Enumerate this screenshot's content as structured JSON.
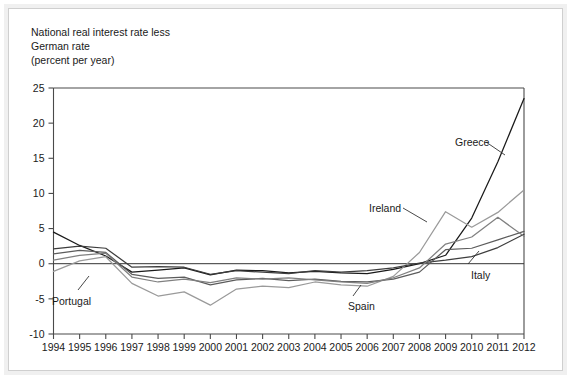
{
  "figure": {
    "title_lines": "National real interest rate less\nGerman rate\n(percent per year)",
    "background_color": "#ffffff",
    "border_color": "#cfcfcf"
  },
  "axes": {
    "y_label_25": "25",
    "y_label_20": "20",
    "y_label_15": "15",
    "y_label_10": "10",
    "y_label_5": "5",
    "y_label_0": "0",
    "y_label_neg5": "-5",
    "y_label_neg10": "-10",
    "x_1994": "1994",
    "x_1995": "1995",
    "x_1996": "1996",
    "x_1997": "1997",
    "x_1998": "1998",
    "x_1999": "1999",
    "x_2000": "2000",
    "x_2001": "2001",
    "x_2002": "2002",
    "x_2003": "2003",
    "x_2004": "2004",
    "x_2005": "2005",
    "x_2006": "2006",
    "x_2007": "2007",
    "x_2008": "2008",
    "x_2009": "2009",
    "x_2010": "2010",
    "x_2011": "2011",
    "x_2012": "2012"
  },
  "annotations": {
    "greece": "Greece",
    "ireland": "Ireland",
    "italy": "Italy",
    "spain": "Spain",
    "portugal": "Portugal"
  },
  "chart_data": {
    "type": "line",
    "title": "National real interest rate less German rate (percent per year)",
    "xlabel": "",
    "ylabel": "percent per year",
    "xlim": [
      1994,
      2012
    ],
    "ylim": [
      -10,
      25
    ],
    "yticks": [
      -10,
      -5,
      0,
      5,
      10,
      15,
      20,
      25
    ],
    "grid": false,
    "legend": "inline-annotations",
    "x": [
      1994,
      1995,
      1996,
      1997,
      1998,
      1999,
      2000,
      2001,
      2002,
      2003,
      2004,
      2005,
      2006,
      2007,
      2008,
      2009,
      2010,
      2011,
      2012
    ],
    "series": [
      {
        "name": "Greece",
        "color": "#1a1a1a",
        "values": [
          4.5,
          2.6,
          1.1,
          -1.2,
          -0.9,
          -0.6,
          -1.6,
          -0.9,
          -1.0,
          -1.3,
          -1.1,
          -1.3,
          -1.4,
          -0.8,
          0.0,
          1.2,
          6.5,
          14.5,
          23.5
        ]
      },
      {
        "name": "Ireland",
        "color": "#9a9a9a",
        "values": [
          -1.1,
          0.4,
          1.0,
          -2.8,
          -4.6,
          -4.0,
          -5.9,
          -3.6,
          -3.2,
          -3.4,
          -2.6,
          -3.0,
          -3.2,
          -1.8,
          1.6,
          7.4,
          5.2,
          7.3,
          10.5
        ]
      },
      {
        "name": "Italy",
        "color": "#3d3d3d",
        "values": [
          2.1,
          2.5,
          2.2,
          -0.5,
          -0.4,
          -0.5,
          -1.5,
          -1.0,
          -1.2,
          -1.4,
          -1.0,
          -1.2,
          -1.0,
          -0.6,
          0.1,
          0.5,
          1.0,
          2.3,
          4.2
        ]
      },
      {
        "name": "Spain",
        "color": "#5c5c5c",
        "values": [
          1.4,
          1.9,
          1.6,
          -1.5,
          -2.1,
          -1.9,
          -3.0,
          -2.3,
          -2.1,
          -2.4,
          -2.2,
          -2.5,
          -2.6,
          -2.2,
          -1.2,
          2.0,
          2.2,
          3.4,
          4.6
        ]
      },
      {
        "name": "Portugal",
        "color": "#808080",
        "values": [
          0.5,
          1.2,
          1.5,
          -1.9,
          -2.6,
          -2.2,
          -2.7,
          -2.0,
          -2.2,
          -2.0,
          -2.3,
          -2.6,
          -2.8,
          -2.0,
          -0.6,
          2.8,
          3.8,
          6.6,
          3.9
        ]
      }
    ]
  }
}
